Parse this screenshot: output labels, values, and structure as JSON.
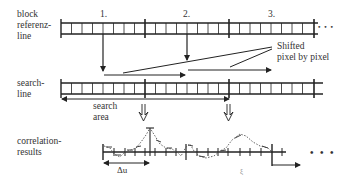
{
  "row_labels": {
    "block_reference": [
      "block",
      "referenz-",
      "line"
    ],
    "search_line": [
      "search-",
      "line"
    ],
    "correlation": [
      "correlation-",
      "results"
    ]
  },
  "block_numbers": [
    "1.",
    "2.",
    "3."
  ],
  "annotations": {
    "shifted": [
      "Shifted",
      "pixel by pixel"
    ],
    "search_area": [
      "search",
      "area"
    ],
    "delta_u": "Δu",
    "xi": "ξ",
    "ellipsis": "• • •"
  },
  "colors": {
    "line": "#222222",
    "text": "#333333",
    "dotted_curve": "#555555",
    "background": "#ffffff"
  }
}
